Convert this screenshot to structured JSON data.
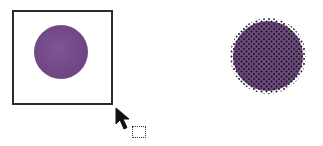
{
  "scene": {
    "description": "drag-select illustration",
    "colors": {
      "fill": "#6e4584",
      "frame": "#2b2b2b",
      "selection_dots": "#1a0f1f"
    }
  },
  "left_panel": {
    "shape": "circle",
    "state": "unselected",
    "frame": "square"
  },
  "right_panel": {
    "shape": "circle",
    "state": "selected",
    "pattern": "dotted-halftone"
  },
  "cursor": {
    "icon": "arrow-pointer-icon",
    "modifier": "marquee-select-icon"
  }
}
